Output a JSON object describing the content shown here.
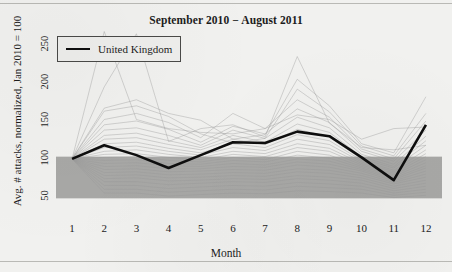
{
  "chart_data": {
    "type": "line",
    "title": "September 2010 − August 2011",
    "xlabel": "Month",
    "ylabel": "Avg. # attacks, normalized, Jan 2010 = 100",
    "x": [
      1,
      2,
      3,
      4,
      5,
      6,
      7,
      8,
      9,
      10,
      11,
      12
    ],
    "xtick_labels": [
      "1",
      "2",
      "3",
      "4",
      "5",
      "6",
      "7",
      "8",
      "9",
      "10",
      "11",
      "12"
    ],
    "ytick_labels": [
      "50",
      "100",
      "150",
      "200",
      "250"
    ],
    "yticks": [
      50,
      100,
      150,
      200,
      250
    ],
    "xlim": [
      0.5,
      12.5
    ],
    "ylim": [
      30,
      270
    ],
    "grid": false,
    "legend": {
      "position": "top-left",
      "entries": [
        {
          "name": "United Kingdom",
          "color": "#0e0e0e",
          "linewidth": 2.5
        }
      ]
    },
    "highlight_band": {
      "description": "dense gray mass of background country series",
      "y_top": 103,
      "y_bottom": 48,
      "color": "#a8a8a6"
    },
    "series": [
      {
        "name": "United Kingdom",
        "highlighted": true,
        "color": "#0e0e0e",
        "values": [
          100,
          118,
          105,
          88,
          105,
          122,
          121,
          136,
          130,
          102,
          72,
          145
        ]
      },
      {
        "name": "background-country-1",
        "highlighted": false,
        "color": "#9a9a98",
        "values": [
          100,
          268,
          152,
          140,
          135,
          133,
          140,
          158,
          152,
          126,
          140,
          142
        ]
      },
      {
        "name": "background-country-2",
        "highlighted": false,
        "color": "#9a9a98",
        "values": [
          100,
          195,
          265,
          123,
          140,
          145,
          129,
          235,
          147,
          115,
          112,
          118
        ]
      },
      {
        "name": "background-country-3",
        "highlighted": false,
        "color": "#9a9a98",
        "values": [
          100,
          167,
          178,
          160,
          151,
          126,
          132,
          205,
          170,
          120,
          108,
          182
        ]
      },
      {
        "name": "background-country-4",
        "highlighted": false,
        "color": "#9a9a98",
        "values": [
          100,
          163,
          170,
          156,
          133,
          121,
          127,
          192,
          162,
          117,
          104,
          160
        ]
      },
      {
        "name": "background-country-5",
        "highlighted": false,
        "color": "#9a9a98",
        "values": [
          100,
          152,
          160,
          148,
          128,
          160,
          140,
          178,
          155,
          113,
          100,
          150
        ]
      },
      {
        "name": "background-country-6",
        "highlighted": false,
        "color": "#9a9a98",
        "values": [
          100,
          145,
          150,
          139,
          122,
          143,
          133,
          166,
          148,
          110,
          97,
          138
        ]
      },
      {
        "name": "background-country-7",
        "highlighted": false,
        "color": "#9a9a98",
        "values": [
          100,
          138,
          141,
          131,
          118,
          138,
          127,
          155,
          141,
          106,
          93,
          130
        ]
      },
      {
        "name": "background-country-8",
        "highlighted": false,
        "color": "#9a9a98",
        "values": [
          100,
          131,
          134,
          124,
          115,
          131,
          122,
          146,
          135,
          103,
          90,
          124
        ]
      },
      {
        "name": "background-country-9",
        "highlighted": false,
        "color": "#9a9a98",
        "values": [
          100,
          126,
          128,
          119,
          112,
          126,
          119,
          139,
          129,
          100,
          88,
          118
        ]
      },
      {
        "name": "background-country-10",
        "highlighted": false,
        "color": "#9a9a98",
        "values": [
          100,
          120,
          122,
          114,
          108,
          120,
          115,
          132,
          124,
          98,
          85,
          112
        ]
      },
      {
        "name": "background-country-11",
        "highlighted": false,
        "color": "#9a9a98",
        "values": [
          100,
          115,
          117,
          110,
          105,
          115,
          111,
          126,
          119,
          96,
          83,
          107
        ]
      },
      {
        "name": "background-country-12",
        "highlighted": false,
        "color": "#9a9a98",
        "values": [
          100,
          110,
          112,
          106,
          102,
          110,
          107,
          120,
          114,
          94,
          81,
          103
        ]
      },
      {
        "name": "background-country-13",
        "highlighted": false,
        "color": "#9a9a98",
        "values": [
          100,
          106,
          107,
          102,
          99,
          106,
          103,
          115,
          110,
          92,
          79,
          99
        ]
      },
      {
        "name": "background-country-14",
        "highlighted": false,
        "color": "#9a9a98",
        "values": [
          100,
          102,
          103,
          98,
          96,
          102,
          99,
          110,
          105,
          90,
          77,
          95
        ]
      },
      {
        "name": "background-country-15",
        "highlighted": false,
        "color": "#9a9a98",
        "values": [
          100,
          98,
          99,
          94,
          93,
          98,
          96,
          105,
          101,
          88,
          75,
          91
        ]
      },
      {
        "name": "background-country-16",
        "highlighted": false,
        "color": "#9a9a98",
        "values": [
          100,
          94,
          95,
          91,
          90,
          94,
          92,
          100,
          97,
          86,
          73,
          88
        ]
      },
      {
        "name": "background-country-17",
        "highlighted": false,
        "color": "#9a9a98",
        "values": [
          100,
          90,
          91,
          87,
          87,
          90,
          89,
          96,
          93,
          84,
          71,
          84
        ]
      },
      {
        "name": "background-country-18",
        "highlighted": false,
        "color": "#9a9a98",
        "values": [
          100,
          86,
          87,
          83,
          84,
          86,
          85,
          92,
          89,
          81,
          69,
          80
        ]
      },
      {
        "name": "background-country-19",
        "highlighted": false,
        "color": "#9a9a98",
        "values": [
          100,
          82,
          83,
          79,
          80,
          82,
          81,
          87,
          85,
          78,
          67,
          76
        ]
      },
      {
        "name": "background-country-20",
        "highlighted": false,
        "color": "#9a9a98",
        "values": [
          100,
          78,
          79,
          75,
          76,
          78,
          77,
          83,
          81,
          75,
          64,
          72
        ]
      },
      {
        "name": "background-country-21",
        "highlighted": false,
        "color": "#9a9a98",
        "values": [
          100,
          74,
          75,
          71,
          72,
          74,
          73,
          78,
          76,
          72,
          61,
          68
        ]
      },
      {
        "name": "background-country-22",
        "highlighted": false,
        "color": "#9a9a98",
        "values": [
          100,
          70,
          70,
          66,
          68,
          70,
          69,
          74,
          72,
          68,
          58,
          64
        ]
      },
      {
        "name": "background-country-23",
        "highlighted": false,
        "color": "#9a9a98",
        "values": [
          100,
          65,
          65,
          61,
          63,
          65,
          64,
          69,
          67,
          64,
          55,
          60
        ]
      },
      {
        "name": "background-country-24",
        "highlighted": false,
        "color": "#9a9a98",
        "values": [
          100,
          60,
          60,
          56,
          58,
          60,
          59,
          64,
          62,
          60,
          52,
          56
        ]
      },
      {
        "name": "background-country-25",
        "highlighted": false,
        "color": "#9a9a98",
        "values": [
          100,
          55,
          55,
          51,
          53,
          55,
          54,
          58,
          57,
          55,
          49,
          52
        ]
      }
    ]
  }
}
